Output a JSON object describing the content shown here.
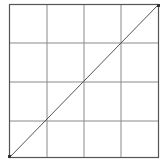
{
  "curves": {
    "title": "",
    "grid_divisions": 4,
    "colors": {
      "background": "#ffffff",
      "border": "#555555",
      "grid": "#8a8a8a",
      "curve": "#555555",
      "control_point": "#333333"
    },
    "box": {
      "x": 9,
      "y": 4,
      "width": 150,
      "height": 154
    },
    "control_points": [
      {
        "input": 0,
        "output": 0
      },
      {
        "input": 255,
        "output": 255
      }
    ]
  }
}
